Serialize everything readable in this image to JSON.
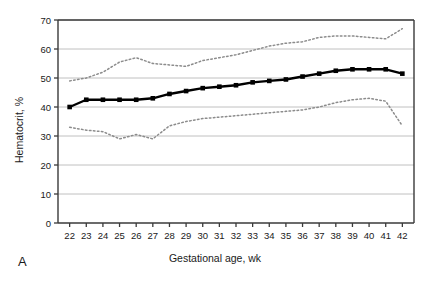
{
  "panel": {
    "label": "A"
  },
  "chart_data": {
    "type": "line",
    "title": "",
    "xlabel": "Gestational age, wk",
    "ylabel": "Hematocrit, %",
    "xlim": [
      21.3,
      42.7
    ],
    "ylim": [
      0,
      70
    ],
    "ytick_step": 10,
    "grid": "horizontal",
    "legend_position": "none",
    "x": [
      22,
      23,
      24,
      25,
      26,
      27,
      28,
      29,
      30,
      31,
      32,
      33,
      34,
      35,
      36,
      37,
      38,
      39,
      40,
      41,
      42
    ],
    "xticklabels": [
      "22",
      "23",
      "24",
      "25",
      "26",
      "27",
      "28",
      "29",
      "30",
      "31",
      "32",
      "33",
      "34",
      "35",
      "36",
      "37",
      "38",
      "39",
      "40",
      "41",
      "42"
    ],
    "yticklabels": [
      "0",
      "10",
      "20",
      "30",
      "40",
      "50",
      "60",
      "70"
    ],
    "yticks": [
      0,
      10,
      20,
      30,
      40,
      50,
      60,
      70
    ],
    "series": [
      {
        "name": "Upper reference limit",
        "style": "dotted",
        "color": "#8c8c8c",
        "marker": "none",
        "values": [
          49.0,
          50.0,
          52.0,
          55.5,
          57.0,
          55.0,
          54.5,
          54.0,
          56.0,
          57.0,
          58.0,
          59.5,
          61.0,
          62.0,
          62.5,
          64.0,
          64.5,
          64.5,
          64.0,
          63.5,
          67.0
        ]
      },
      {
        "name": "Mean hematocrit",
        "style": "solid",
        "color": "#000000",
        "marker": "square",
        "values": [
          40.0,
          42.5,
          42.5,
          42.5,
          42.5,
          43.0,
          44.5,
          45.5,
          46.5,
          47.0,
          47.5,
          48.5,
          49.0,
          49.5,
          50.5,
          51.5,
          52.5,
          53.0,
          53.0,
          53.0,
          51.5
        ]
      },
      {
        "name": "Lower reference limit",
        "style": "dotted",
        "color": "#8c8c8c",
        "marker": "none",
        "values": [
          33.0,
          32.0,
          31.5,
          29.0,
          30.5,
          29.0,
          33.5,
          35.0,
          36.0,
          36.5,
          37.0,
          37.5,
          38.0,
          38.5,
          39.0,
          40.0,
          41.5,
          42.5,
          43.0,
          42.0,
          33.5
        ]
      }
    ]
  }
}
